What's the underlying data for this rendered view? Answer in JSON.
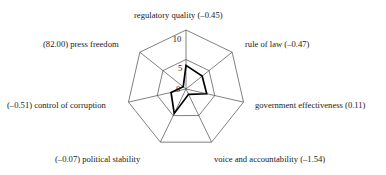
{
  "chart_data": {
    "type": "radar",
    "title": "",
    "subtitle": "",
    "xlabel": "",
    "ylabel": "",
    "grid": true,
    "legend": "none",
    "rlim": [
      0,
      10
    ],
    "rings": [
      0,
      5,
      10
    ],
    "tick_labels": [
      "0",
      "5",
      "10"
    ],
    "categories": [
      "regulatory quality (–0.45)",
      "rule of law (–0.47)",
      "government effectiveness (0.11)",
      "voice and accountability (–1.54)",
      "(–0.07) political stability",
      "(–0.51) control of corruption",
      "(82.00) press freedom"
    ],
    "category_names": [
      "regulatory quality",
      "rule of law",
      "government effectiveness",
      "voice and accountability",
      "political stability",
      "control of corruption",
      "press freedom"
    ],
    "category_values": [
      -0.45,
      -0.47,
      0.11,
      -1.54,
      -0.07,
      -0.51,
      82.0
    ],
    "series": [
      {
        "name": "score",
        "values": [
          4.0,
          3.5,
          3.6,
          1.0,
          4.6,
          2.6,
          0.6
        ]
      }
    ],
    "colors": {
      "grid": "#4a4a4a",
      "data_stroke": "#000000",
      "text": "#1a1a1a",
      "background": "#ffffff"
    }
  },
  "ticks": {
    "t0": "0",
    "t5": "5",
    "t10": "10"
  },
  "labels": {
    "top": "regulatory quality (–0.45)",
    "upper_right": "rule of law (–0.47)",
    "right": "government effectiveness (0.11)",
    "lower_right": "voice and accountability (–1.54)",
    "lower_left": "(–0.07) political stability",
    "left": "(–0.51) control of corruption",
    "upper_left": "(82.00) press freedom"
  }
}
